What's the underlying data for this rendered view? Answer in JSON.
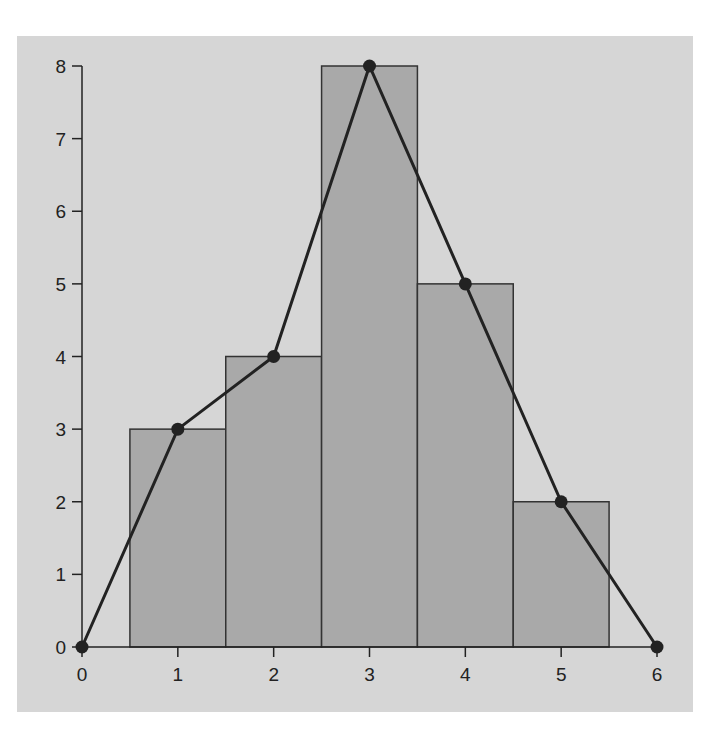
{
  "chart_data": {
    "type": "bar",
    "subtype": "histogram-with-frequency-polygon",
    "title": "",
    "xlabel": "",
    "ylabel": "",
    "xlim": [
      0,
      6
    ],
    "ylim": [
      0,
      8
    ],
    "grid": false,
    "legend": null,
    "x_ticks": [
      "0",
      "1",
      "2",
      "3",
      "4",
      "5",
      "6"
    ],
    "y_ticks": [
      "0",
      "1",
      "2",
      "3",
      "4",
      "5",
      "6",
      "7",
      "8"
    ],
    "categories": [
      "1",
      "2",
      "3",
      "4",
      "5"
    ],
    "series": [
      {
        "name": "histogram",
        "type": "bar",
        "values": [
          3,
          4,
          8,
          5,
          2
        ],
        "bin_width": 1
      },
      {
        "name": "frequency polygon",
        "type": "line",
        "x": [
          0,
          1,
          2,
          3,
          4,
          5,
          6
        ],
        "values": [
          0,
          3,
          4,
          8,
          5,
          2,
          0
        ],
        "markers": true
      }
    ],
    "colors": {
      "background": "#d6d6d6",
      "bars": "#a9a9a9",
      "line": "#222222"
    }
  }
}
